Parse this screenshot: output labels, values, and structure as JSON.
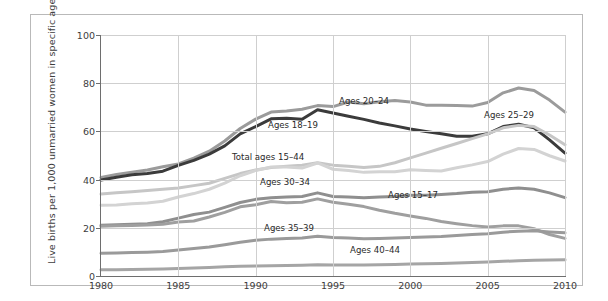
{
  "chart_data": {
    "type": "line",
    "title": "",
    "xlabel": "",
    "ylabel": "Live births per 1,000 unmarried women in specific age group",
    "xlim": [
      1980,
      2010
    ],
    "ylim": [
      0,
      100
    ],
    "yticks": [
      0,
      20,
      40,
      60,
      80,
      100
    ],
    "xticks": [
      1980,
      1985,
      1990,
      1995,
      2000,
      2005,
      2010
    ],
    "grid": true,
    "legend_position": "inline-annotations",
    "x": [
      1980,
      1981,
      1982,
      1983,
      1984,
      1985,
      1986,
      1987,
      1988,
      1989,
      1990,
      1991,
      1992,
      1993,
      1994,
      1995,
      1996,
      1997,
      1998,
      1999,
      2000,
      2001,
      2002,
      2003,
      2004,
      2005,
      2006,
      2007,
      2008,
      2009,
      2010
    ],
    "series": [
      {
        "name": "Ages 20-24",
        "label": "Ages 20–24",
        "color": "#9b9b9b",
        "width": 3.0,
        "values": [
          40.9,
          42.1,
          43.1,
          44.0,
          45.3,
          46.5,
          48.9,
          51.8,
          56.0,
          61.2,
          65.1,
          68.0,
          68.5,
          69.2,
          70.7,
          70.3,
          72.2,
          71.5,
          72.3,
          72.8,
          72.2,
          70.9,
          70.9,
          70.7,
          70.5,
          72.0,
          76.0,
          78.0,
          77.0,
          73.0,
          68.0
        ]
      },
      {
        "name": "Ages 18-19",
        "label": "Ages 18–19",
        "color": "#3b3b3b",
        "width": 3.0,
        "values": [
          39.8,
          41.0,
          42.0,
          42.5,
          43.5,
          45.9,
          48.0,
          50.6,
          54.0,
          59.0,
          62.0,
          65.2,
          65.5,
          65.0,
          69.0,
          67.6,
          66.3,
          65.0,
          63.5,
          62.3,
          61.0,
          60.0,
          59.0,
          58.0,
          58.0,
          59.0,
          62.0,
          63.0,
          61.5,
          56.5,
          51.0
        ]
      },
      {
        "name": "Ages 25-29",
        "label": "Ages 25–29",
        "color": "#c6c6c6",
        "width": 3.0,
        "values": [
          34.0,
          34.5,
          35.0,
          35.5,
          36.0,
          36.5,
          37.5,
          38.5,
          40.5,
          42.5,
          44.0,
          45.0,
          45.5,
          46.0,
          47.0,
          46.0,
          45.5,
          45.0,
          45.5,
          47.0,
          49.0,
          51.0,
          53.0,
          55.0,
          57.0,
          59.0,
          61.5,
          62.5,
          62.0,
          58.5,
          54.5
        ]
      },
      {
        "name": "Total ages 15-44",
        "label": "Total ages 15–44",
        "color": "#d3d3d3",
        "width": 3.0,
        "values": [
          29.4,
          29.5,
          30.0,
          30.3,
          31.0,
          32.8,
          34.2,
          36.0,
          38.5,
          41.6,
          43.8,
          45.2,
          45.2,
          44.8,
          46.9,
          44.3,
          43.8,
          43.0,
          43.3,
          43.3,
          44.1,
          43.8,
          43.6,
          44.9,
          46.1,
          47.5,
          50.6,
          52.9,
          52.5,
          49.9,
          47.7
        ]
      },
      {
        "name": "Ages 30-34",
        "label": "Ages 30–34",
        "color": "#8f8f8f",
        "width": 3.0,
        "values": [
          21.1,
          21.3,
          21.5,
          21.7,
          22.5,
          24.0,
          25.5,
          26.5,
          28.5,
          30.5,
          31.8,
          32.5,
          32.8,
          33.0,
          34.5,
          33.0,
          32.8,
          32.5,
          32.8,
          33.0,
          33.5,
          33.5,
          33.8,
          34.2,
          34.8,
          35.0,
          36.0,
          36.5,
          36.0,
          34.5,
          32.5
        ]
      },
      {
        "name": "Ages 15-17",
        "label": "Ages 15–17",
        "color": "#9f9f9f",
        "width": 3.0,
        "values": [
          20.6,
          20.8,
          21.0,
          21.2,
          21.5,
          22.4,
          22.8,
          24.5,
          26.4,
          28.7,
          29.6,
          30.9,
          30.4,
          30.6,
          32.0,
          30.6,
          29.8,
          28.8,
          27.3,
          26.0,
          24.9,
          23.9,
          22.6,
          21.7,
          20.9,
          20.3,
          20.8,
          20.8,
          19.6,
          17.2,
          15.6
        ]
      },
      {
        "name": "Ages 35-39",
        "label": "Ages 35–39",
        "color": "#9a9a9a",
        "width": 3.0,
        "values": [
          9.4,
          9.5,
          9.7,
          9.9,
          10.2,
          10.8,
          11.4,
          12.0,
          13.0,
          14.0,
          14.8,
          15.3,
          15.6,
          15.8,
          16.5,
          16.0,
          15.8,
          15.5,
          15.6,
          15.8,
          16.0,
          16.2,
          16.4,
          16.8,
          17.2,
          17.5,
          18.2,
          18.6,
          18.8,
          18.3,
          17.9
        ]
      },
      {
        "name": "Ages 40-44",
        "label": "Ages 40–44",
        "color": "#a5a5a5",
        "width": 3.0,
        "values": [
          2.6,
          2.6,
          2.7,
          2.8,
          2.9,
          3.1,
          3.3,
          3.5,
          3.8,
          4.0,
          4.2,
          4.3,
          4.4,
          4.5,
          4.7,
          4.6,
          4.6,
          4.6,
          4.7,
          4.8,
          5.0,
          5.1,
          5.2,
          5.4,
          5.6,
          5.8,
          6.1,
          6.3,
          6.5,
          6.6,
          6.7
        ]
      }
    ],
    "annotations": [
      {
        "text": "Ages 20–24",
        "x": 339,
        "y": 96
      },
      {
        "text": "Ages 18–19",
        "x": 268,
        "y": 120
      },
      {
        "text": "Ages 25–29",
        "x": 484,
        "y": 110
      },
      {
        "text": "Total ages 15–44",
        "x": 232,
        "y": 152
      },
      {
        "text": "Ages 30–34",
        "x": 260,
        "y": 177
      },
      {
        "text": "Ages 15–17",
        "x": 388,
        "y": 190
      },
      {
        "text": "Ages 35–39",
        "x": 264,
        "y": 223
      },
      {
        "text": "Ages 40–44",
        "x": 350,
        "y": 245
      }
    ]
  },
  "axes": {
    "ytick_labels": [
      "0",
      "20",
      "40",
      "60",
      "80",
      "100"
    ],
    "xtick_labels": [
      "1980",
      "1985",
      "1990",
      "1995",
      "2000",
      "2005",
      "2010"
    ],
    "ylabel_text": "Live births per 1,000 unmarried women in specific age group"
  },
  "colors": {
    "grid": "#cfcfcf",
    "axis": "#6e6e6e",
    "frame": "#b9b9b9",
    "text": "#3d3d3d",
    "background": "#ffffff"
  }
}
